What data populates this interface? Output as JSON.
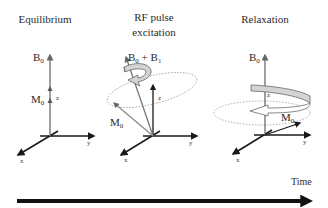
{
  "panels": [
    {
      "title": "Equilibrium",
      "field_label": "B",
      "field_sub": "0",
      "magnetization_label": "M",
      "magnetization_sub": "0",
      "axes": {
        "z": "z",
        "y": "y",
        "x": "x"
      }
    },
    {
      "title_line1": "RF pulse",
      "title_line2": "excitation",
      "field_label": "B",
      "field_sub": "0",
      "field_plus": " + B",
      "field_sub2": "1",
      "magnetization_label": "M",
      "magnetization_sub": "0",
      "axes": {
        "z": "z",
        "y": "y",
        "x": "x"
      }
    },
    {
      "title": "Relaxation",
      "field_label": "B",
      "field_sub": "0",
      "magnetization_label": "M",
      "magnetization_sub": "0",
      "axes": {
        "z": "z",
        "y": "y",
        "x": "x"
      }
    }
  ],
  "timeline": {
    "label": "Time"
  },
  "colors": {
    "axis": "#1a1a1a",
    "vector": "#777777",
    "ribbon_fill": "#d4d4d4",
    "dotted": "#999999"
  }
}
